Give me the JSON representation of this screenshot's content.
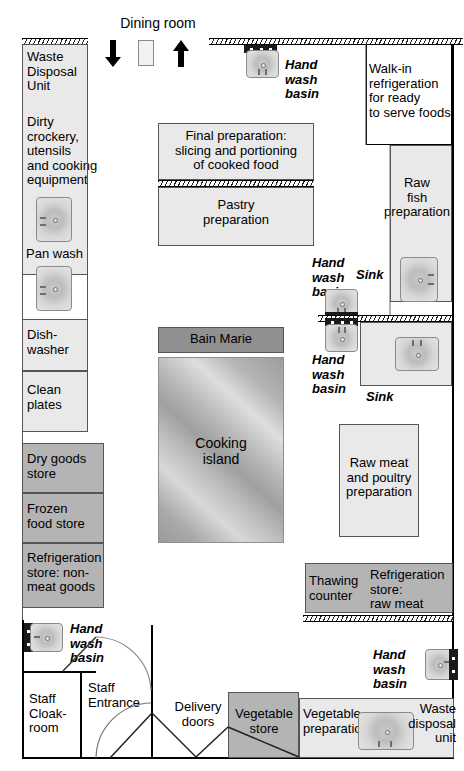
{
  "diagram": {
    "dining_room_label": "Dining room",
    "colors": {
      "fill_light": "#e9e9e9",
      "fill_mid": "#b4b4b4",
      "fill_dark": "#909090",
      "wall": "#000000",
      "text": "#000000"
    }
  },
  "left_wing": {
    "waste_disposal_unit": "Waste\nDisposal\nUnit",
    "dirty_crockery": "Dirty crockery,\nutensils\nand cooking\nequipment",
    "pan_wash": "Pan wash",
    "dishwasher": "Dish-\nwasher",
    "clean_plates": "Clean\nplates",
    "dry_goods_store": "Dry goods\nstore",
    "frozen_food_store": "Frozen\nfood store",
    "refrigeration_store_non_meat": "Refrigeration\nstore: non-\nmeat goods",
    "hand_wash_basin": "Hand\nwash\nbasin",
    "staff_cloakroom": "Staff\nCloak-\nroom",
    "staff_entrance": "Staff\nEntrance"
  },
  "centre": {
    "final_preparation": "Final preparation:\nslicing and portioning\nof cooked food",
    "pastry_preparation": "Pastry\npreparation",
    "bain_marie": "Bain Marie",
    "cooking_island": "Cooking\nisland"
  },
  "right_wing": {
    "hand_wash_basin_top": "Hand\nwash\nbasin",
    "walk_in_refrigeration": "Walk-in\nrefrigeration\nfor ready\nto serve foods",
    "raw_fish_preparation": "Raw\nfish\npreparation",
    "sink_upper": "Sink",
    "hand_wash_basin_upper": "Hand\nwash\nbasin",
    "hand_wash_basin_lower": "Hand\nwash\nbasin",
    "sink_lower": "Sink",
    "raw_meat_poultry": "Raw meat\nand poultry\npreparation",
    "thawing_counter": "Thawing\ncounter",
    "refrigeration_store_raw_meat": "Refrigeration\nstore:\nraw meat",
    "hand_wash_basin_bottom": "Hand\nwash\nbasin"
  },
  "bottom": {
    "delivery_doors": "Delivery\ndoors",
    "vegetable_store": "Vegetable\nstore",
    "vegetable_preparation": "Vegetable\npreparation",
    "waste_disposal_unit": "Waste\ndisposal\nunit"
  },
  "icons": {
    "arrow_down": "arrow-down-icon",
    "arrow_up": "arrow-up-icon",
    "service_door": "service-door-icon"
  }
}
